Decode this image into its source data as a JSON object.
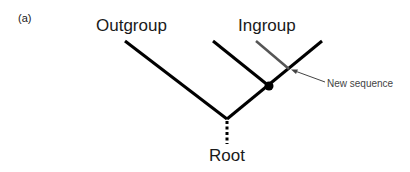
{
  "diagram": {
    "panel_label": "(a)",
    "nodes": {
      "outgroup": "Outgroup",
      "ingroup": "Ingroup",
      "root": "Root",
      "new_sequence": "New sequence"
    },
    "colors": {
      "branch": "#000000",
      "new_sequence_branch": "#555555",
      "arrow": "#444444"
    },
    "edges": [
      {
        "from": "root",
        "to": "outgroup",
        "style": "solid"
      },
      {
        "from": "root",
        "to": "ingroup-node",
        "style": "solid"
      },
      {
        "from": "ingroup-node",
        "to": "ingroup-left-tip",
        "style": "solid"
      },
      {
        "from": "ingroup-node",
        "to": "ingroup-right-tip",
        "style": "solid"
      },
      {
        "from": "ingroup-right-branch",
        "to": "new-sequence-tip",
        "style": "solid-gray"
      },
      {
        "from": "root",
        "to": "below-root",
        "style": "dotted"
      }
    ]
  }
}
